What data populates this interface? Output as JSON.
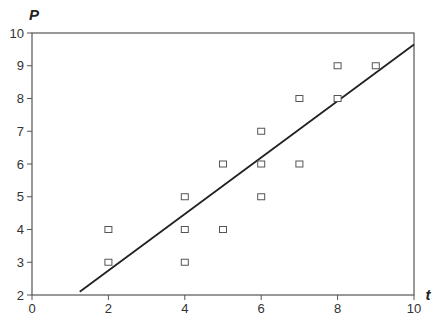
{
  "chart_data": {
    "type": "scatter",
    "title": "",
    "xlabel": "t",
    "ylabel": "P",
    "xlim": [
      0,
      10
    ],
    "ylim": [
      2,
      10
    ],
    "x_ticks": [
      0,
      2,
      4,
      6,
      8,
      10
    ],
    "y_ticks": [
      2,
      3,
      4,
      5,
      6,
      7,
      8,
      9,
      10
    ],
    "grid": false,
    "legend": null,
    "marker": "open-square",
    "series": [
      {
        "name": "observations",
        "points": [
          {
            "x": 2,
            "y": 4
          },
          {
            "x": 2,
            "y": 3
          },
          {
            "x": 4,
            "y": 5
          },
          {
            "x": 4,
            "y": 4
          },
          {
            "x": 4,
            "y": 3
          },
          {
            "x": 5,
            "y": 6
          },
          {
            "x": 5,
            "y": 4
          },
          {
            "x": 6,
            "y": 7
          },
          {
            "x": 6,
            "y": 6
          },
          {
            "x": 6,
            "y": 5
          },
          {
            "x": 7,
            "y": 8
          },
          {
            "x": 7,
            "y": 6
          },
          {
            "x": 8,
            "y": 9
          },
          {
            "x": 8,
            "y": 8
          },
          {
            "x": 9,
            "y": 9
          }
        ]
      }
    ],
    "fit_line": {
      "name": "regression line",
      "start": {
        "x": 1.25,
        "y": 2.1
      },
      "end": {
        "x": 10,
        "y": 9.65
      }
    }
  },
  "colors": {
    "axis": "#555555",
    "marker": "#555555",
    "line": "#222222"
  }
}
